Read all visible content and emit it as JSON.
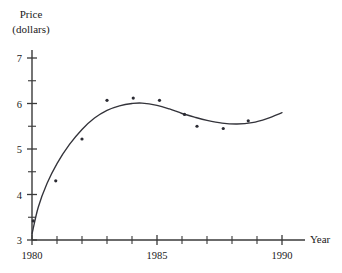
{
  "chart_data": {
    "type": "scatter",
    "title": "",
    "xlabel": "Year",
    "ylabel": "Price (dollars)",
    "ylabel_line1": "Price",
    "ylabel_line2": "(dollars)",
    "xlim": [
      1980,
      1990
    ],
    "ylim": [
      3,
      7
    ],
    "grid": false,
    "legend": null,
    "x_tick_labels": [
      "1980",
      "1985",
      "1990"
    ],
    "x_tick_values": [
      1980,
      1985,
      1990
    ],
    "x_minor_ticks": [
      1981,
      1982,
      1983,
      1984,
      1986,
      1987,
      1988,
      1989
    ],
    "y_tick_labels": [
      "3",
      "4",
      "5",
      "6",
      "7"
    ],
    "y_tick_values": [
      3,
      4,
      5,
      6,
      7
    ],
    "y_minor_ticks": [
      3.5,
      4.5,
      5.5,
      6.5
    ],
    "points": [
      {
        "x": 1980.05,
        "y": 3.42
      },
      {
        "x": 1980.95,
        "y": 4.3
      },
      {
        "x": 1982.0,
        "y": 5.22
      },
      {
        "x": 1983.0,
        "y": 6.07
      },
      {
        "x": 1984.05,
        "y": 6.12
      },
      {
        "x": 1985.1,
        "y": 6.07
      },
      {
        "x": 1986.1,
        "y": 5.76
      },
      {
        "x": 1986.6,
        "y": 5.5
      },
      {
        "x": 1987.65,
        "y": 5.45
      },
      {
        "x": 1988.65,
        "y": 5.62
      }
    ],
    "curve": [
      {
        "x": 1980.0,
        "y": 3.13
      },
      {
        "x": 1980.25,
        "y": 3.72
      },
      {
        "x": 1980.6,
        "y": 4.24
      },
      {
        "x": 1981.0,
        "y": 4.68
      },
      {
        "x": 1981.5,
        "y": 5.1
      },
      {
        "x": 1982.0,
        "y": 5.43
      },
      {
        "x": 1982.5,
        "y": 5.68
      },
      {
        "x": 1983.0,
        "y": 5.85
      },
      {
        "x": 1983.5,
        "y": 5.95
      },
      {
        "x": 1984.0,
        "y": 6.0
      },
      {
        "x": 1984.4,
        "y": 6.01
      },
      {
        "x": 1985.0,
        "y": 5.96
      },
      {
        "x": 1985.5,
        "y": 5.88
      },
      {
        "x": 1986.0,
        "y": 5.78
      },
      {
        "x": 1986.5,
        "y": 5.7
      },
      {
        "x": 1987.0,
        "y": 5.63
      },
      {
        "x": 1987.6,
        "y": 5.57
      },
      {
        "x": 1988.2,
        "y": 5.55
      },
      {
        "x": 1988.8,
        "y": 5.58
      },
      {
        "x": 1989.4,
        "y": 5.67
      },
      {
        "x": 1990.0,
        "y": 5.8
      }
    ]
  }
}
